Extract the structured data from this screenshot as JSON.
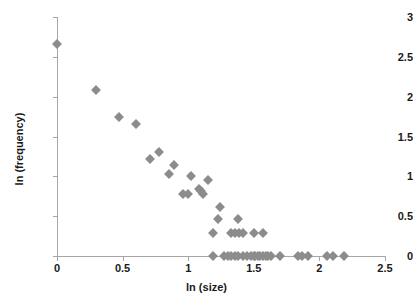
{
  "chart_data": {
    "type": "scatter",
    "title": "",
    "xlabel": "ln (size)",
    "ylabel": "ln (frequency)",
    "xlim": [
      0,
      2.5
    ],
    "ylim": [
      0,
      3
    ],
    "xticks": [
      "0",
      "0.5",
      "1",
      "1.5",
      "2",
      "2.5"
    ],
    "xtick_values": [
      0,
      0.5,
      1,
      1.5,
      2,
      2.5
    ],
    "yticks": [
      "0",
      "0.5",
      "1",
      "1.5",
      "2",
      "2.5",
      "3"
    ],
    "ytick_values": [
      0,
      0.5,
      1,
      1.5,
      2,
      2.5,
      3
    ],
    "grid": false,
    "legend": false,
    "marker": "diamond",
    "marker_color": "#8c8c8c",
    "axis_color": "#a6a6a6",
    "series": [
      {
        "name": "observations",
        "points": [
          [
            0.0,
            2.66
          ],
          [
            0.3,
            2.08
          ],
          [
            0.47,
            1.75
          ],
          [
            0.6,
            1.66
          ],
          [
            0.71,
            1.22
          ],
          [
            0.78,
            1.3
          ],
          [
            0.85,
            1.03
          ],
          [
            0.89,
            1.14
          ],
          [
            1.02,
            1.0
          ],
          [
            1.15,
            0.95
          ],
          [
            0.96,
            0.78
          ],
          [
            1.0,
            0.78
          ],
          [
            1.08,
            0.84
          ],
          [
            1.1,
            0.82
          ],
          [
            1.11,
            0.78
          ],
          [
            1.24,
            0.61
          ],
          [
            1.23,
            0.47
          ],
          [
            1.38,
            0.47
          ],
          [
            1.19,
            0.29
          ],
          [
            1.33,
            0.29
          ],
          [
            1.36,
            0.29
          ],
          [
            1.39,
            0.29
          ],
          [
            1.42,
            0.29
          ],
          [
            1.5,
            0.29
          ],
          [
            1.57,
            0.29
          ],
          [
            1.19,
            0.0
          ],
          [
            1.27,
            0.0
          ],
          [
            1.3,
            0.0
          ],
          [
            1.33,
            0.0
          ],
          [
            1.36,
            0.0
          ],
          [
            1.38,
            0.0
          ],
          [
            1.42,
            0.0
          ],
          [
            1.45,
            0.0
          ],
          [
            1.48,
            0.0
          ],
          [
            1.5,
            0.0
          ],
          [
            1.51,
            0.0
          ],
          [
            1.53,
            0.0
          ],
          [
            1.55,
            0.0
          ],
          [
            1.57,
            0.0
          ],
          [
            1.59,
            0.0
          ],
          [
            1.61,
            0.0
          ],
          [
            1.63,
            0.0
          ],
          [
            1.7,
            0.0
          ],
          [
            1.84,
            0.0
          ],
          [
            1.87,
            0.0
          ],
          [
            1.91,
            0.0
          ],
          [
            2.06,
            0.0
          ],
          [
            2.1,
            0.0
          ],
          [
            2.19,
            0.0
          ]
        ]
      }
    ]
  }
}
